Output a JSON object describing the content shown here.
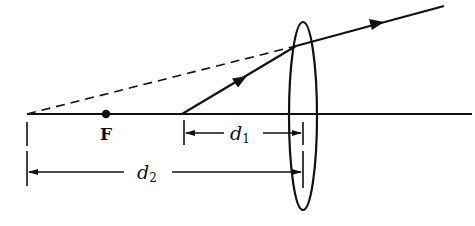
{
  "diagram": {
    "type": "optics-lens-ray-diagram",
    "colors": {
      "ink": "#111111",
      "background": "#ffffff"
    },
    "labels": {
      "focal_point": "F",
      "d1_var": "d",
      "d1_sub": "1",
      "d2_var": "d",
      "d2_sub": "2"
    },
    "elements": {
      "optical_axis": "horizontal principal axis",
      "lens": "thin converging lens (ellipse)",
      "focal_point": "F marked by a dot on the axis",
      "incident_ray": "ray starting on axis at distance d1 from lens, arrow toward lens",
      "refracted_ray": "ray leaving lens, arrow pointing away",
      "virtual_extension": "dashed line tracing refracted ray back to the axis at distance d2",
      "dimension_d1": "distance from ray origin to lens",
      "dimension_d2": "distance from virtual image point to lens"
    }
  }
}
